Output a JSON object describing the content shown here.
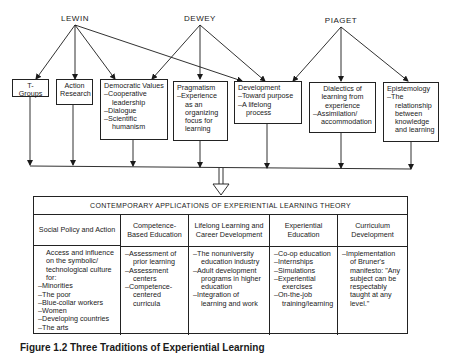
{
  "authors": [
    {
      "name": "LEWIN"
    },
    {
      "name": "DEWEY"
    },
    {
      "name": "PIAGET"
    }
  ],
  "concepts": [
    {
      "title": "T-Groups",
      "items": []
    },
    {
      "title": "Action Research",
      "items": []
    },
    {
      "title": "Democratic Values",
      "items": [
        "Cooperative leadership",
        "Dialogue",
        "Scientific humanism"
      ]
    },
    {
      "title": "Pragmatism",
      "items": [
        "Experience as an organizing focus for learning"
      ]
    },
    {
      "title": "Development",
      "items": [
        "Toward purpose",
        "A lifelong process"
      ]
    },
    {
      "title": "Dialectics of learning from experience",
      "items": [
        "Assimilation/ accommodation"
      ]
    },
    {
      "title": "Epistemology",
      "items": [
        "The relationship between knowledge and learning"
      ]
    }
  ],
  "table": {
    "title": "CONTEMPORARY APPLICATIONS OF EXPERIENTIAL LEARNING THEORY",
    "columns": [
      {
        "header": "Social Policy and Action",
        "intro": "Access and influence on the symbolic/ technological culture for:",
        "items": [
          "Minorities",
          "The poor",
          "Blue-collar workers",
          "Women",
          "Developing countries",
          "The arts"
        ]
      },
      {
        "header": "Competence-Based Education",
        "intro": "",
        "items": [
          "Assessment of prior learning",
          "Assessment centers",
          "Competence-centered curricula"
        ]
      },
      {
        "header": "Lifelong Learning and Career Development",
        "intro": "",
        "items": [
          "The nonuniversity education industry",
          "Adult development programs in higher education",
          "Integration of learning and work"
        ]
      },
      {
        "header": "Experiential Education",
        "intro": "",
        "items": [
          "Co-op education",
          "Internships",
          "Simulations",
          "Experiential exercises",
          "On-the-job training/learning"
        ]
      },
      {
        "header": "Curriculum Development",
        "intro": "",
        "items": [
          "Implementation of Bruner's manifesto: \"Any subject can be respectably taught at any level.\""
        ]
      }
    ]
  },
  "caption": "Figure 1.2 Three Traditions of Experiential Learning"
}
